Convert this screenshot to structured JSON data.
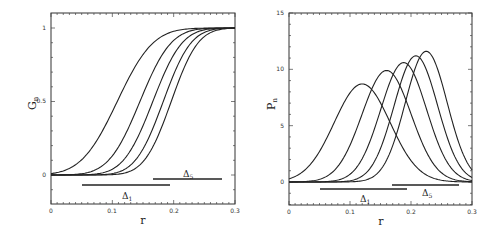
{
  "chart_data": [
    {
      "type": "line",
      "panel": "left",
      "title": "",
      "xlabel": "r",
      "ylabel": "G",
      "ylabel_sub": "n",
      "xlim": [
        0,
        0.3
      ],
      "ylim": [
        -0.2,
        1.08
      ],
      "grid": false,
      "x_ticks": [
        "0",
        "0.1",
        "0.2",
        "0.3"
      ],
      "y_ticks": [
        "0",
        "0.5",
        "1"
      ],
      "series": [
        {
          "name": "n=1",
          "cdf_mid": 0.108,
          "sigma": 0.046
        },
        {
          "name": "n=2",
          "cdf_mid": 0.145,
          "sigma": 0.04
        },
        {
          "name": "n=3",
          "cdf_mid": 0.166,
          "sigma": 0.0376
        },
        {
          "name": "n=4",
          "cdf_mid": 0.183,
          "sigma": 0.0356
        },
        {
          "name": "n=5",
          "cdf_mid": 0.196,
          "sigma": 0.0344
        }
      ],
      "annotations": [
        {
          "label": "Δ",
          "sub": "1",
          "x_start": 0.05,
          "x_end": 0.195,
          "y": -0.05
        },
        {
          "label": "Δ",
          "sub": "5",
          "x_start": 0.167,
          "x_end": 0.28,
          "y": -0.02
        }
      ]
    },
    {
      "type": "line",
      "panel": "right",
      "title": "",
      "xlabel": "r",
      "ylabel": "P",
      "ylabel_sub": "n",
      "xlim": [
        0,
        0.3
      ],
      "ylim": [
        -2.0,
        15
      ],
      "grid": false,
      "x_ticks": [
        "0",
        "0.1",
        "0.2",
        "0.3"
      ],
      "y_ticks": [
        "0",
        "5",
        "10",
        "15"
      ],
      "series": [
        {
          "name": "n=1",
          "peak_x": 0.12,
          "peak_y": 8.7
        },
        {
          "name": "n=2",
          "peak_x": 0.16,
          "peak_y": 9.9
        },
        {
          "name": "n=3",
          "peak_x": 0.188,
          "peak_y": 10.6
        },
        {
          "name": "n=4",
          "peak_x": 0.208,
          "peak_y": 11.2
        },
        {
          "name": "n=5",
          "peak_x": 0.225,
          "peak_y": 11.6
        }
      ],
      "annotations": [
        {
          "label": "Δ",
          "sub": "1",
          "x_start": 0.05,
          "x_end": 0.195,
          "y": -1.3
        },
        {
          "label": "Δ",
          "sub": "5",
          "x_start": 0.17,
          "x_end": 0.28,
          "y": -0.6
        }
      ]
    }
  ],
  "left": {
    "ylabel": "G",
    "ylabel_sub": "n",
    "xlabel": "r",
    "yticks": [
      "0",
      "0.5",
      "1"
    ],
    "xticks": [
      "0",
      "0.1",
      "0.2",
      "0.3"
    ],
    "delta1": {
      "label": "Δ",
      "sub": "1"
    },
    "delta5": {
      "label": "Δ",
      "sub": "5"
    }
  },
  "right": {
    "ylabel": "P",
    "ylabel_sub": "n",
    "xlabel": "r",
    "yticks": [
      "0",
      "5",
      "10",
      "15"
    ],
    "xticks": [
      "0",
      "0.1",
      "0.2",
      "0.3"
    ],
    "delta1": {
      "label": "Δ",
      "sub": "1"
    },
    "delta5": {
      "label": "Δ",
      "sub": "5"
    }
  }
}
